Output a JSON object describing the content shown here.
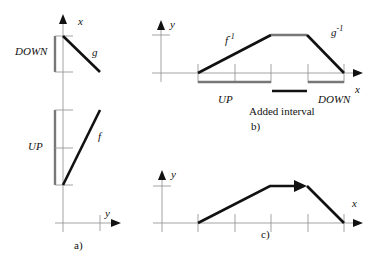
{
  "panels": {
    "a": {
      "caption": "a)",
      "x_axis_label": "x",
      "y_axis_label": "y",
      "interval_labels": {
        "down": "DOWN",
        "up": "UP"
      },
      "curve_labels": {
        "g": "g",
        "f": "f"
      }
    },
    "b": {
      "caption": "b)",
      "x_axis_label": "x",
      "y_axis_label": "y",
      "interval_labels": {
        "up": "UP",
        "down": "DOWN",
        "added": "Added interval"
      },
      "curve_labels": {
        "f_inv": "f",
        "f_inv_sup": "-1",
        "g_inv": "g",
        "g_inv_sup": "-1"
      }
    },
    "c": {
      "caption": "c)",
      "x_axis_label": "x",
      "y_axis_label": "y"
    }
  },
  "colors": {
    "axis": "#999999",
    "curve": "#111111",
    "interval": "#777777"
  }
}
